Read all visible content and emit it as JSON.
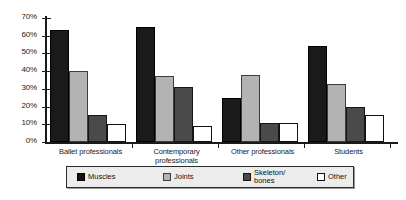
{
  "chart_data": {
    "type": "bar",
    "title": "",
    "subtitle": "",
    "xlabel": "",
    "ylabel": "",
    "ylim": [
      0,
      70
    ],
    "ytick_labels": [
      "0%",
      "10%",
      "20%",
      "30%",
      "40%",
      "50%",
      "60%",
      "70%"
    ],
    "ytick_values": [
      0,
      10,
      20,
      30,
      40,
      50,
      60,
      70
    ],
    "grid": false,
    "legend_position": "bottom",
    "categories": [
      "Ballet professionals",
      "Contemporary\nprofessionals",
      "Other professionals",
      "Students"
    ],
    "series": [
      {
        "name": "Muscles",
        "color": "#1a1a1a",
        "values": [
          63,
          65,
          25,
          54
        ]
      },
      {
        "name": "Joints",
        "color": "#b3b3b3",
        "values": [
          40,
          37,
          38,
          33
        ]
      },
      {
        "name": "Skeleton/\nbones",
        "color": "#4a4a4a",
        "values": [
          15,
          31,
          11,
          20
        ]
      },
      {
        "name": "Other",
        "color": "#ffffff",
        "values": [
          10,
          9,
          11,
          15
        ]
      }
    ]
  },
  "legend": {
    "items": [
      {
        "label": "Muscles"
      },
      {
        "label": "Joints"
      },
      {
        "label": "Skeleton/\nbones"
      },
      {
        "label": "Other"
      }
    ]
  }
}
